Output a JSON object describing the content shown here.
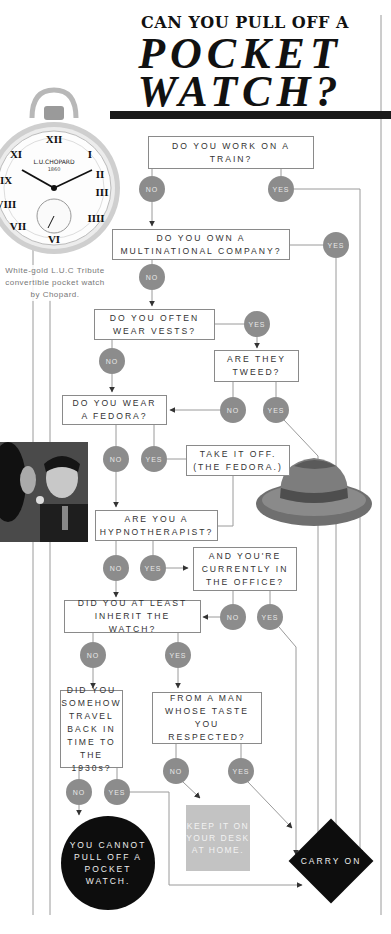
{
  "title": {
    "line1": "CAN YOU PULL OFF A",
    "line2": "POCKET",
    "line3": "WATCH?"
  },
  "watch_image": {
    "brand_text": "L.U.CHOPARD",
    "year_text": "1860",
    "caption": "White-gold L.U.C Tribute convertible pocket watch by Chopard."
  },
  "flowchart": {
    "questions": [
      {
        "id": "q1",
        "text": "DO YOU WORK ON A TRAIN?"
      },
      {
        "id": "q2",
        "text": "DO YOU OWN A MULTINATIONAL COMPANY?"
      },
      {
        "id": "q3",
        "text": "DO YOU OFTEN WEAR VESTS?"
      },
      {
        "id": "q4",
        "text": "ARE THEY TWEED?"
      },
      {
        "id": "q5",
        "text": "DO YOU WEAR A FEDORA?"
      },
      {
        "id": "q6",
        "text": "TAKE IT OFF. (THE FEDORA.)"
      },
      {
        "id": "q7",
        "text": "ARE YOU A HYPNOTHERAPIST?"
      },
      {
        "id": "q8",
        "text": "AND YOU'RE CURRENTLY IN THE OFFICE?"
      },
      {
        "id": "q9",
        "text": "DID YOU AT LEAST INHERIT THE WATCH?"
      },
      {
        "id": "q10",
        "text": "DID YOU SOMEHOW TRAVEL BACK IN TIME TO THE 1930s?"
      },
      {
        "id": "q11",
        "text": "FROM A MAN WHOSE TASTE YOU RESPECTED?"
      }
    ],
    "answers": {
      "no": "NO",
      "yes": "YES"
    },
    "outcomes": {
      "cannot": "YOU CANNOT PULL OFF A POCKET WATCH.",
      "keep": "KEEP IT ON YOUR DESK AT HOME.",
      "carry_on": "CARRY ON"
    }
  },
  "colors": {
    "answer_dot": "#8c8c8c",
    "outcome_dark": "#0d0d0d",
    "keep_box": "#c3c3c3",
    "line": "#9a9a9a",
    "title_bar": "#1a1a1a"
  }
}
